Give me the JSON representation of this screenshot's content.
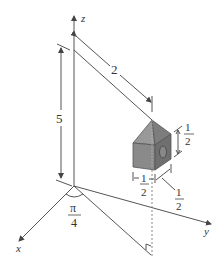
{
  "figure": {
    "axes": {
      "x_label": "x",
      "y_label": "y",
      "z_label": "z"
    },
    "angle_label": {
      "numerator": "π",
      "denominator": "4"
    },
    "dimensions": {
      "height": "5",
      "rod_length": "2",
      "cube_height": {
        "numerator": "1",
        "denominator": "2"
      },
      "cube_width": {
        "numerator": "1",
        "denominator": "2"
      },
      "cube_depth": {
        "numerator": "1",
        "denominator": "2"
      }
    },
    "colors": {
      "line": "#555555",
      "cube_front": "#8a8a8a",
      "cube_side": "#6f6f6f",
      "cube_top": "#9a9a9a",
      "dashed": "#888888"
    }
  }
}
